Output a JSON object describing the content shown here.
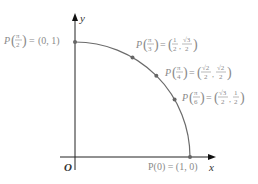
{
  "axes": {
    "x_label": "x",
    "y_label": "y",
    "origin_label": "O"
  },
  "colors": {
    "axis": "#222222",
    "arc": "#6b6b6b",
    "point": "#666666",
    "label": "#8a8a8a"
  },
  "points": [
    {
      "id": "p-pi-2",
      "angle_label": "π/2",
      "angle": 1.5707963,
      "P": "P",
      "num": "π",
      "den": "2",
      "eq": "=",
      "value": "(0, 1)"
    },
    {
      "id": "p-pi-3",
      "angle_label": "π/3",
      "angle": 1.0471976,
      "P": "P",
      "num": "π",
      "den": "3",
      "eq": "=",
      "x_num": "1",
      "x_den": "2",
      "y_num": "√3",
      "y_den": "2"
    },
    {
      "id": "p-pi-4",
      "angle_label": "π/4",
      "angle": 0.7853982,
      "P": "P",
      "num": "π",
      "den": "4",
      "eq": "=",
      "x_num": "√2",
      "x_den": "2",
      "y_num": "√2",
      "y_den": "2"
    },
    {
      "id": "p-pi-6",
      "angle_label": "π/6",
      "angle": 0.5235988,
      "P": "P",
      "num": "π",
      "den": "6",
      "eq": "=",
      "x_num": "√3",
      "x_den": "2",
      "y_num": "1",
      "y_den": "2"
    },
    {
      "id": "p-0",
      "angle_label": "0",
      "angle": 0,
      "text": "P(0) = (1, 0)"
    }
  ]
}
